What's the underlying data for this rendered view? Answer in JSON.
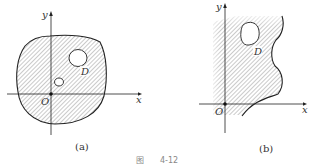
{
  "figure": {
    "caption_prefix": "图",
    "caption_number": "4-12",
    "panels": [
      {
        "id": "a",
        "label": "(a)",
        "axes": {
          "x_label": "x",
          "y_label": "y",
          "origin_label": "O"
        },
        "region_label": "D",
        "description": "Closed bounded region D containing the origin, with two holes"
      },
      {
        "id": "b",
        "label": "(b)",
        "axes": {
          "x_label": "x",
          "y_label": "y",
          "origin_label": "O"
        },
        "region_label": "D",
        "description": "Unbounded region D with one hole and a wavy right boundary"
      }
    ]
  },
  "colors": {
    "line": "#222222",
    "hatch": "#8a8a8a",
    "background": "#ffffff"
  }
}
